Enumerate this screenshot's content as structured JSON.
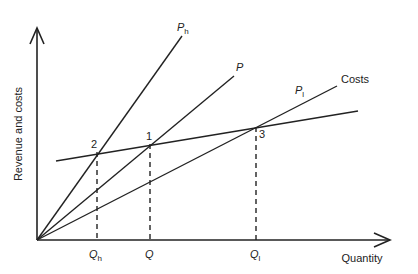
{
  "diagram": {
    "title": "",
    "axes": {
      "y_label": "Revenue and costs",
      "x_label": "Quantity",
      "origin": [
        37,
        240
      ],
      "x_end": [
        390,
        240
      ],
      "y_end": [
        37,
        28
      ]
    },
    "lines": [
      {
        "name": "Ph",
        "label_main": "P",
        "label_sub": "h",
        "from": [
          37,
          240
        ],
        "to": [
          182,
          36
        ],
        "label_pos": [
          177,
          31
        ]
      },
      {
        "name": "P",
        "label_main": "P",
        "label_sub": "",
        "from": [
          37,
          240
        ],
        "to": [
          234,
          76
        ],
        "label_pos": [
          236,
          71
        ]
      },
      {
        "name": "Pl",
        "label_main": "P",
        "label_sub": "l",
        "from": [
          37,
          240
        ],
        "to": [
          337,
          86
        ],
        "label_pos": [
          295,
          94
        ]
      },
      {
        "name": "Costs",
        "label_main": "Costs",
        "label_sub": "",
        "from": [
          56,
          161
        ],
        "to": [
          358,
          111
        ],
        "label_pos": [
          341,
          83
        ]
      }
    ],
    "points": [
      {
        "id": "2",
        "x": 97,
        "y": 152,
        "label_pos": [
          91,
          148
        ],
        "q_label_main": "Q",
        "q_label_sub": "h",
        "q_label_pos": [
          89,
          258
        ]
      },
      {
        "id": "1",
        "x": 150,
        "y": 144,
        "label_pos": [
          146,
          140
        ],
        "q_label_main": "Q",
        "q_label_sub": "",
        "q_label_pos": [
          145,
          258
        ]
      },
      {
        "id": "3",
        "x": 256,
        "y": 127,
        "label_pos": [
          259,
          138
        ],
        "q_label_main": "Q",
        "q_label_sub": "l",
        "q_label_pos": [
          250,
          258
        ]
      }
    ],
    "colors": {
      "stroke": "#222222",
      "background": "#ffffff"
    }
  }
}
